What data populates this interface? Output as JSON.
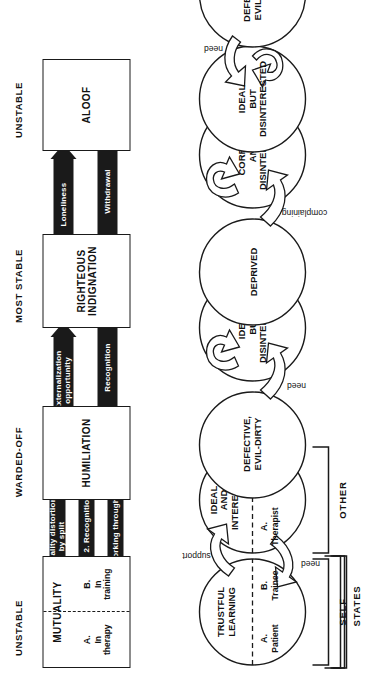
{
  "figure": {
    "orientation": "rotated-90-ccw",
    "row_labels": [
      "STATES",
      "SELF",
      "OTHER"
    ],
    "column_headers": [
      "UNSTABLE",
      "WARDED-OFF",
      "MOST STABLE",
      "UNSTABLE"
    ]
  },
  "states": {
    "boxes": [
      {
        "id": "mutuality",
        "title": "MUTUALITY",
        "split": true,
        "left": {
          "letter": "A.",
          "text": "In\ntherapy"
        },
        "right": {
          "letter": "B.",
          "text": "In\ntraining"
        }
      },
      {
        "id": "humiliation",
        "title": "HUMILIATION",
        "split": false
      },
      {
        "id": "righteous-indignation",
        "title": "RIGHTEOUS\nINDIGNATION",
        "split": false
      },
      {
        "id": "aloof",
        "title": "ALOOF",
        "split": false
      }
    ],
    "arrows": [
      {
        "id": "reality-distortion",
        "label": "1. Reality distortion\nby split",
        "direction": "right"
      },
      {
        "id": "recognition-1",
        "label": "2. Recognition",
        "direction": "left"
      },
      {
        "id": "working-through",
        "label": "3. Working through",
        "direction": "right"
      },
      {
        "id": "externalization-opportunity",
        "label": "Externalization\nopportunity",
        "direction": "right"
      },
      {
        "id": "recognition-2",
        "label": "Recognition",
        "direction": "left"
      },
      {
        "id": "loneliness",
        "label": "Loneliness",
        "direction": "right"
      },
      {
        "id": "withdrawal",
        "label": "Withdrawal",
        "direction": "left"
      }
    ]
  },
  "self_row": {
    "circles": [
      {
        "id": "trustful-learning",
        "title": [
          "TRUSTFUL",
          "LEARNING"
        ],
        "split": true,
        "left": {
          "letter": "A.",
          "text": "Patient"
        },
        "right": {
          "letter": "B.",
          "text": "Trainee"
        }
      },
      {
        "id": "defective-evil-dirty-1",
        "title": [
          "DEFECTIVE,",
          "EVIL-DIRTY"
        ],
        "split": false
      },
      {
        "id": "deprived",
        "title": [
          "DEPRIVED"
        ],
        "split": false
      },
      {
        "id": "ideal-but-disinterested-top",
        "title": [
          "IDEAL",
          "BUT",
          "DISINTERESTED"
        ],
        "split": false
      }
    ]
  },
  "other_row": {
    "circles": [
      {
        "id": "ideal-and-interested",
        "title": [
          "IDEAL",
          "AND",
          "INTERESTED"
        ],
        "split": true,
        "left": {
          "letter": "A.",
          "text": "Therapist"
        },
        "right": {
          "letter": "B.",
          "text": "Mentor"
        }
      },
      {
        "id": "ideal-but-disinterested",
        "title": [
          "IDEAL",
          "BUT",
          "DISINTERESTED"
        ],
        "split": false
      },
      {
        "id": "corrupt-and-disinterested",
        "title": [
          "CORRUPT",
          "AND",
          "DISINTERESTED"
        ],
        "split": false
      },
      {
        "id": "defective-evil-dirty-2",
        "title": [
          "DEFECTIVE,",
          "EVIL-DIRTY"
        ],
        "split": false
      }
    ]
  },
  "connector_labels": {
    "support": "support",
    "need_1": "need",
    "need_2": "need",
    "complaining": "complaining",
    "need_3": "need"
  },
  "colors": {
    "ink": "#1a1a1a",
    "paper": "#ffffff",
    "arrow_fill": "#1a1a1a",
    "arrow_text": "#ffffff"
  }
}
